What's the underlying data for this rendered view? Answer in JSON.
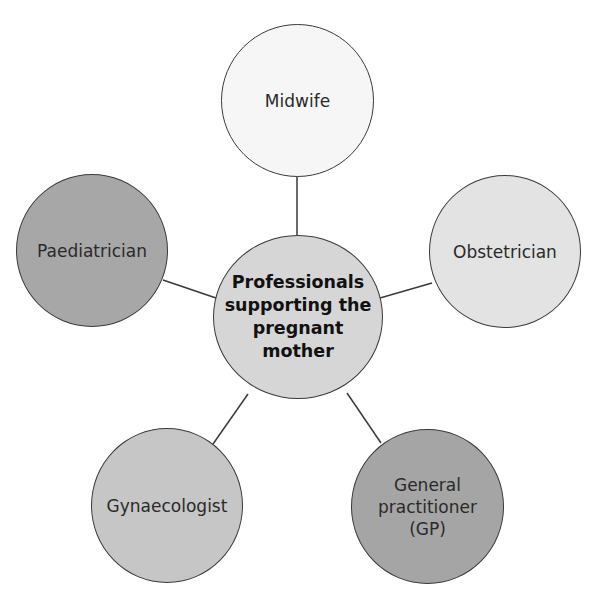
{
  "diagram": {
    "type": "hub-and-spoke",
    "center": {
      "label": "Professionals supporting the pregnant mother",
      "lines": [
        "Professionals",
        "supporting the",
        "pregnant",
        "mother"
      ],
      "fill": "#d6d6d6"
    },
    "nodes": [
      {
        "id": "midwife",
        "label": "Midwife",
        "fill": "#f6f6f6"
      },
      {
        "id": "obstetrician",
        "label": "Obstetrician",
        "fill": "#e3e3e3"
      },
      {
        "id": "gp",
        "label": "General practitioner (GP)",
        "lines": [
          "General",
          "practitioner",
          "(GP)"
        ],
        "fill": "#a5a5a5"
      },
      {
        "id": "gynaecologist",
        "label": "Gynaecologist",
        "fill": "#c6c6c6"
      },
      {
        "id": "paediatrician",
        "label": "Paediatrician",
        "fill": "#a7a7a7"
      }
    ]
  }
}
